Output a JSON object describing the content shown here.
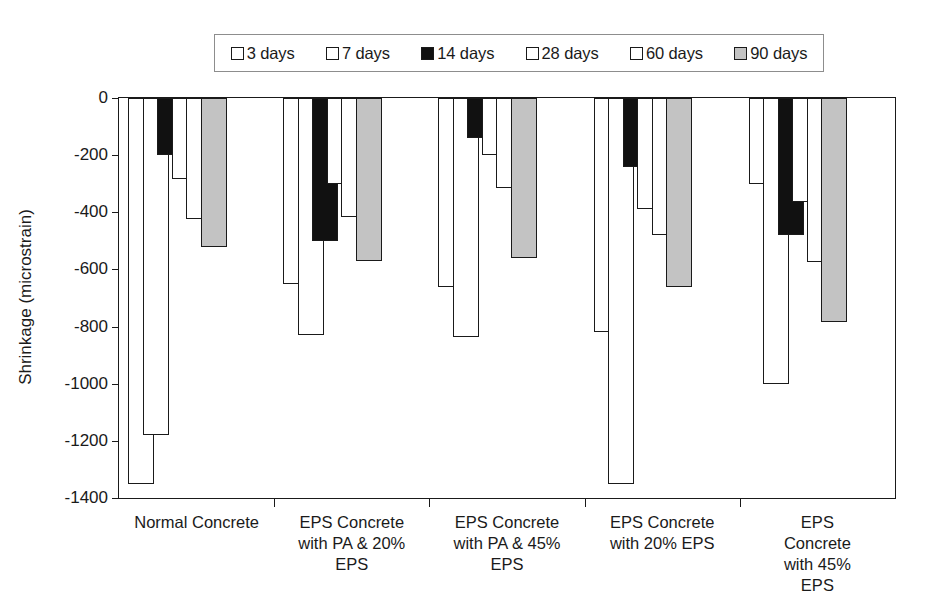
{
  "chart_data": {
    "type": "bar",
    "title": "",
    "xlabel": "",
    "ylabel": "Shrinkage (microstrain)",
    "ylim": [
      -1400,
      0
    ],
    "yticks": [
      0,
      -200,
      -400,
      -600,
      -800,
      -1000,
      -1200,
      -1400
    ],
    "ytick_labels": [
      "0",
      "-200",
      "-400",
      "-600",
      "-800",
      "-1000",
      "-1200",
      "-1400"
    ],
    "grid": false,
    "legend_position": "top",
    "bar_style": "overlapping",
    "categories": [
      "Normal Concrete",
      "EPS Concrete\nwith PA & 20%\nEPS",
      "EPS Concrete\nwith PA & 45%\nEPS",
      "EPS Concrete\nwith 20% EPS",
      "EPS Concrete\nwith 45% EPS"
    ],
    "series": [
      {
        "name": "3 days",
        "fill": "white",
        "color": "#ffffff",
        "values": [
          -1350,
          -650,
          -660,
          -820,
          -300
        ]
      },
      {
        "name": "7 days",
        "fill": "white",
        "color": "#ffffff",
        "values": [
          -1180,
          -830,
          -835,
          -1350,
          -1000
        ]
      },
      {
        "name": "14 days",
        "fill": "black",
        "color": "#111111",
        "values": [
          -200,
          -500,
          -140,
          -240,
          -480
        ]
      },
      {
        "name": "28 days",
        "fill": "white",
        "color": "#ffffff",
        "values": [
          -285,
          -300,
          -200,
          -390,
          -365
        ]
      },
      {
        "name": "60 days",
        "fill": "white",
        "color": "#ffffff",
        "values": [
          -425,
          -415,
          -315,
          -480,
          -575
        ]
      },
      {
        "name": "90 days",
        "fill": "gray",
        "color": "#c3c3c3",
        "values": [
          -520,
          -570,
          -560,
          -660,
          -785
        ]
      }
    ],
    "legend": [
      {
        "label": "3 days",
        "swatch": "white"
      },
      {
        "label": "7 days",
        "swatch": "white"
      },
      {
        "label": "14 days",
        "swatch": "black"
      },
      {
        "label": "28 days",
        "swatch": "white"
      },
      {
        "label": "60 days",
        "swatch": "white"
      },
      {
        "label": "90 days",
        "swatch": "gray"
      }
    ],
    "bars": [
      {
        "group": 0,
        "series": 0,
        "label": "3 days",
        "top": 0,
        "bottom": -1350,
        "fill": "white"
      },
      {
        "group": 0,
        "series": 1,
        "label": "7 days",
        "top": 0,
        "bottom": -1400,
        "fill": "white"
      },
      {
        "group": 0,
        "series": 2,
        "label": "14 days",
        "top": 0,
        "bottom": -1400,
        "fill": "black"
      },
      {
        "group": 0,
        "series": 3,
        "label": "28 days",
        "top": -200,
        "bottom": -1400,
        "fill": "white"
      },
      {
        "group": 0,
        "series": 4,
        "label": "60 days",
        "top": -285,
        "bottom": -1400,
        "fill": "white"
      },
      {
        "group": 0,
        "series": 5,
        "label": "90 days",
        "top": -425,
        "bottom": -1400,
        "fill": "white"
      },
      {
        "group": 0,
        "series": 6,
        "label": "90 days",
        "top": -520,
        "bottom": -1400,
        "fill": "black"
      },
      {
        "group": 0,
        "series": 7,
        "label": "90 days",
        "top": -610,
        "bottom": -1400,
        "fill": "gray"
      }
    ]
  },
  "axis": {
    "y_title": "Shrinkage (microstrain)"
  }
}
